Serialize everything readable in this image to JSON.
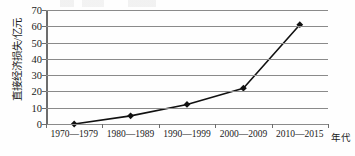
{
  "chart_data": {
    "type": "line",
    "title": "",
    "subtitle": "",
    "xlabel": "年代",
    "ylabel": "直接经济损失/亿元",
    "categories": [
      "1970—1979",
      "1980—1989",
      "1990—1999",
      "2000—2009",
      "2010—2015"
    ],
    "series": [
      {
        "name": "直接经济损失",
        "values": [
          0,
          5,
          12,
          22,
          61
        ],
        "marker": "diamond",
        "color": "#111111"
      }
    ],
    "ylim": [
      0,
      70
    ],
    "yticks": [
      0,
      10,
      20,
      30,
      40,
      50,
      60,
      70
    ],
    "ytick_labels": [
      "0",
      "10",
      "20",
      "30",
      "40",
      "50",
      "60",
      "70"
    ],
    "grid": "horizontal",
    "legend": "none",
    "annotations": []
  },
  "axis": {
    "y_title": "直接经济损失/亿元",
    "x_title": "年代"
  }
}
